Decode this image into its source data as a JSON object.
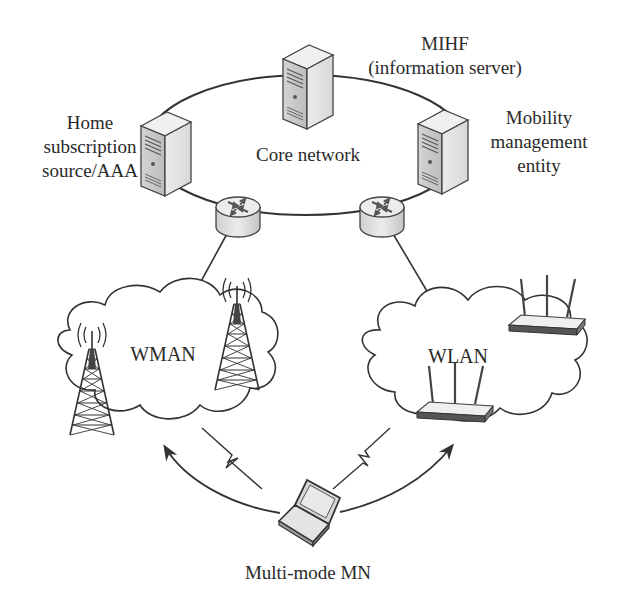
{
  "diagram": {
    "core": {
      "label": "Core network",
      "servers": [
        {
          "id": "mihf",
          "lines": [
            "MIHF",
            "(information server)"
          ]
        },
        {
          "id": "home",
          "lines": [
            "Home",
            "subscription",
            "source/AAA"
          ]
        },
        {
          "id": "mme",
          "lines": [
            "Mobility",
            "management",
            "entity"
          ]
        }
      ],
      "routers": [
        "router-left",
        "router-right"
      ]
    },
    "access_networks": [
      {
        "id": "wman",
        "label": "WMAN",
        "devices": [
          "cell-tower",
          "cell-tower"
        ]
      },
      {
        "id": "wlan",
        "label": "WLAN",
        "devices": [
          "wireless-access-point",
          "wireless-access-point"
        ]
      }
    ],
    "mobile_node": {
      "label": "Multi-mode MN",
      "icon": "laptop-icon"
    },
    "links": [
      {
        "from": "router-left",
        "to": "wman",
        "type": "wired"
      },
      {
        "from": "router-right",
        "to": "wlan",
        "type": "wired"
      },
      {
        "from": "mn",
        "to": "wman",
        "type": "wireless"
      },
      {
        "from": "mn",
        "to": "wlan",
        "type": "wireless"
      }
    ],
    "colors": {
      "line": "#333333",
      "device_fill": "#e6e6e6",
      "device_shade": "#bdbdbd",
      "text": "#2a2a2a"
    }
  }
}
